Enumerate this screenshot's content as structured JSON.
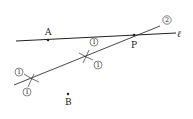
{
  "diagram": {
    "points": {
      "A": {
        "label": "A",
        "x": 48,
        "y": 40
      },
      "P": {
        "label": "P",
        "x": 134,
        "y": 35
      },
      "B": {
        "label": "B",
        "x": 68,
        "y": 94
      }
    },
    "line_l": {
      "label": "ℓ",
      "x1": 16,
      "y1": 41,
      "x2": 176,
      "y2": 33
    },
    "construction_line": {
      "x1": 14,
      "y1": 85,
      "x2": 160,
      "y2": 26
    },
    "step_markers": {
      "m1a": {
        "text": "1",
        "x": 19,
        "y": 72
      },
      "m1b": {
        "text": "1",
        "x": 27,
        "y": 92
      },
      "m1c": {
        "text": "1",
        "x": 94,
        "y": 42
      },
      "m1d": {
        "text": "1",
        "x": 98,
        "y": 65
      },
      "m2": {
        "text": "2",
        "x": 167,
        "y": 20
      }
    },
    "colors": {
      "ink": "#222222",
      "background": "#ffffff"
    }
  }
}
